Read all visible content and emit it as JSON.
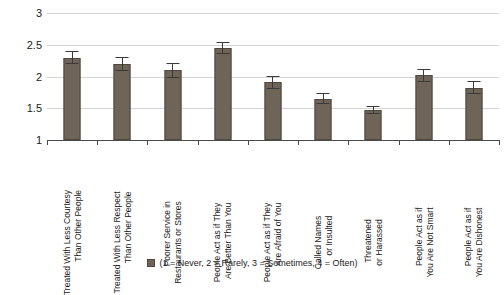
{
  "chart_data": {
    "type": "bar",
    "title": "",
    "xlabel": "",
    "ylabel": "",
    "ylim": [
      1,
      3
    ],
    "yticks": [
      1,
      1.5,
      2,
      2.5,
      3
    ],
    "ytick_labels": [
      "1",
      "1.5",
      "2",
      "2.5",
      "3"
    ],
    "grid": true,
    "legend_position": "bottom",
    "legend": [
      "(1 = Never, 2 = Rarely, 3 = Sometimes, 4 = Often)"
    ],
    "series_color": "#6e6558",
    "error_bars": true,
    "categories": [
      "Treated With Less Courtesy Than Other People",
      "Treated With Less Respect Than Other People",
      "Poorer Service in Restaurants or Stores",
      "People Act as if They Are Better Than You",
      "People Act as if They Are Afraid of You",
      "Called Names or Insulted",
      "Threatened or Harassed",
      "People Act as if You Are Not Smart",
      "People Act as if You Are Dishonest"
    ],
    "category_lines": [
      [
        "Treated With Less Courtesy",
        "Than Other People"
      ],
      [
        "Treated With Less Respect",
        "Than Other People"
      ],
      [
        "Poorer Service in",
        "Restaurants or Stores"
      ],
      [
        "People Act as if They",
        "Are Better Than You"
      ],
      [
        "People Act as if They",
        "Are Afraid of You"
      ],
      [
        "Called Names",
        "or Insulted"
      ],
      [
        "Threatened",
        "or Harassed"
      ],
      [
        "People Act as if",
        "You Are Not Smart"
      ],
      [
        "People Act as if",
        "You Are Dishonest"
      ]
    ],
    "values": [
      2.29,
      2.2,
      2.1,
      2.45,
      1.91,
      1.65,
      1.47,
      2.02,
      1.82
    ],
    "error_low": [
      2.19,
      2.09,
      1.97,
      2.36,
      1.81,
      1.57,
      1.41,
      1.92,
      1.72
    ],
    "error_high": [
      2.4,
      2.31,
      2.22,
      2.55,
      2.01,
      1.74,
      1.53,
      2.12,
      1.93
    ]
  },
  "legend_text": "(1 = Never, 2 = Rarely, 3 = Sometimes, 4 = Often)"
}
